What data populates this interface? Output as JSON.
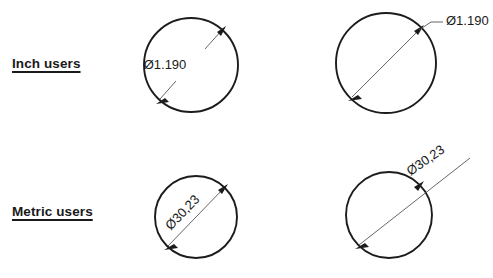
{
  "canvas": {
    "width": 493,
    "height": 278,
    "background": "#ffffff",
    "line_color": "#1c1c1c",
    "dim_line_color": "#555555"
  },
  "rows": {
    "inch": {
      "label": "Inch users",
      "unit_style": "inch",
      "decimal_separator": ".",
      "text_orientation": "horizontal"
    },
    "metric": {
      "label": "Metric users",
      "unit_style": "metric",
      "decimal_separator": ",",
      "text_orientation": "aligned"
    }
  },
  "figures": [
    {
      "id": "inch-inside",
      "row": "inch",
      "dimension_text": "Ø1.190",
      "placement": "inside",
      "text_rotation_deg": 0,
      "circle": {
        "cx": 191,
        "cy": 65,
        "r": 47
      },
      "dim_angle_deg": -48
    },
    {
      "id": "inch-outside",
      "row": "inch",
      "dimension_text": "Ø1.190",
      "placement": "outside",
      "text_rotation_deg": 0,
      "circle": {
        "cx": 386,
        "cy": 63,
        "r": 50
      },
      "dim_angle_deg": -48
    },
    {
      "id": "metric-inside",
      "row": "metric",
      "dimension_text": "Ø30,23",
      "placement": "inside",
      "text_rotation_deg": -46,
      "circle": {
        "cx": 196,
        "cy": 217,
        "r": 41
      },
      "dim_angle_deg": -46
    },
    {
      "id": "metric-outside",
      "row": "metric",
      "dimension_text": "Ø30,23",
      "placement": "outside",
      "text_rotation_deg": -35,
      "circle": {
        "cx": 389,
        "cy": 215,
        "r": 43
      },
      "dim_angle_deg": -35
    }
  ]
}
